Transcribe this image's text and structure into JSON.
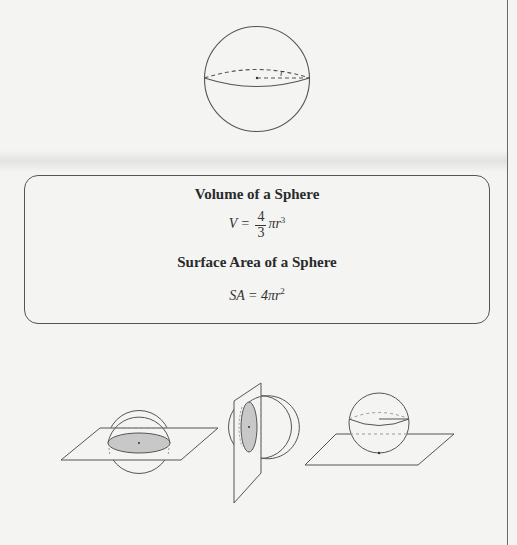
{
  "diagram_top": {
    "label": "sphere-with-radius",
    "radius_label": "r"
  },
  "formula_box": {
    "volume_title": "Volume of a Sphere",
    "volume_lhs": "V =",
    "volume_frac_num": "4",
    "volume_frac_den": "3",
    "volume_rhs": "πr",
    "volume_exp": "3",
    "surface_title": "Surface Area of a Sphere",
    "surface_lhs": "SA = 4πr",
    "surface_exp": "2"
  },
  "diagrams_bottom": [
    {
      "label": "sphere-cut-by-horizontal-plane-through-center"
    },
    {
      "label": "sphere-cut-by-vertical-plane"
    },
    {
      "label": "sphere-tangent-to-plane"
    }
  ],
  "colors": {
    "background": "#f4f4f3",
    "stroke": "#555555",
    "shaded_cross_section": "#c8c8c8"
  }
}
